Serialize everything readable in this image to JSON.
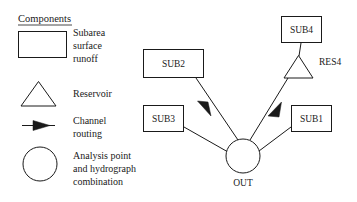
{
  "figure": {
    "type": "schematic-diagram",
    "background_color": "#ffffff",
    "line_color": "#1a1a1a"
  },
  "legend": {
    "title": "Components",
    "entries": [
      {
        "icon": "rectangle",
        "icon_name": "subarea-rectangle-icon",
        "lines": [
          "Subarea",
          "surface",
          "runoff"
        ]
      },
      {
        "icon": "triangle",
        "icon_name": "reservoir-triangle-icon",
        "lines": [
          "Reservoir"
        ]
      },
      {
        "icon": "arrow",
        "icon_name": "channel-routing-arrow-icon",
        "lines": [
          "Channel",
          "routing"
        ]
      },
      {
        "icon": "circle",
        "icon_name": "analysis-point-circle-icon",
        "lines": [
          "Analysis point",
          "and hydrograph",
          "combination"
        ]
      }
    ]
  },
  "diagram": {
    "nodes": [
      {
        "id": "SUB2",
        "label": "SUB2",
        "shape": "rectangle",
        "x": 143,
        "y": 49,
        "w": 61,
        "h": 29
      },
      {
        "id": "SUB3",
        "label": "SUB3",
        "shape": "rectangle",
        "x": 143,
        "y": 105,
        "w": 41,
        "h": 27
      },
      {
        "id": "SUB4",
        "label": "SUB4",
        "shape": "rectangle",
        "x": 281,
        "y": 16,
        "w": 41,
        "h": 27
      },
      {
        "id": "SUB1",
        "label": "SUB1",
        "shape": "rectangle",
        "x": 291,
        "y": 105,
        "w": 41,
        "h": 27
      },
      {
        "id": "RES4",
        "label": "RES4",
        "shape": "triangle",
        "x": 283,
        "y": 55,
        "w": 30,
        "h": 23
      },
      {
        "id": "OUT",
        "label": "OUT",
        "shape": "circle",
        "cx": 243,
        "cy": 156,
        "r": 17
      }
    ],
    "links": [
      {
        "from": "SUB2",
        "to": "OUT",
        "arrow": true
      },
      {
        "from": "SUB3",
        "to": "OUT",
        "arrow": false
      },
      {
        "from": "SUB4",
        "to": "RES4",
        "arrow": false
      },
      {
        "from": "RES4",
        "to": "OUT",
        "arrow": true
      },
      {
        "from": "SUB1",
        "to": "OUT",
        "arrow": false
      }
    ]
  }
}
